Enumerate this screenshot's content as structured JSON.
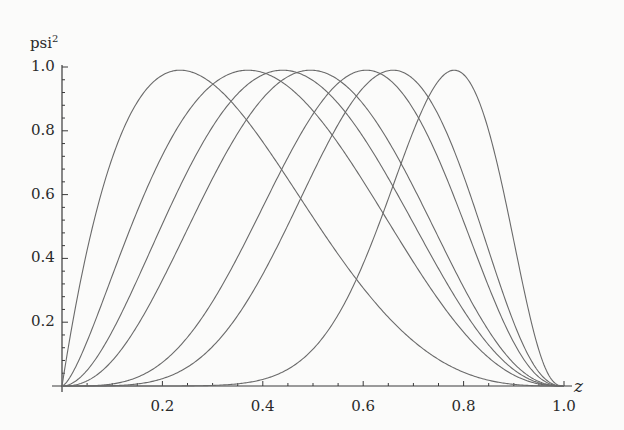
{
  "chart_data": {
    "type": "line",
    "title": "",
    "xlabel": "z",
    "ylabel": "psi",
    "ylabel_sup": "2",
    "xlim": [
      0,
      1.0
    ],
    "ylim": [
      0,
      1.0
    ],
    "x_ticks": [
      0.2,
      0.4,
      0.6,
      0.8,
      1.0
    ],
    "x_tick_labels": [
      "0.2",
      "0.4",
      "0.6",
      "0.8",
      "1.0"
    ],
    "y_ticks": [
      0.2,
      0.4,
      0.6,
      0.8,
      1.0
    ],
    "y_tick_labels": [
      "0.2",
      "0.4",
      "0.6",
      "0.8",
      "1.0"
    ],
    "grid": false,
    "legend": "none",
    "series": [
      {
        "name": "curve-1",
        "peak_z": 0.235,
        "peak_value": 0.99,
        "a": 1.0,
        "b": 3.25
      },
      {
        "name": "curve-2",
        "peak_z": 0.37,
        "peak_value": 0.99,
        "a": 1.5,
        "b": 2.55
      },
      {
        "name": "curve-3",
        "peak_z": 0.44,
        "peak_value": 0.99,
        "a": 2.0,
        "b": 2.55
      },
      {
        "name": "curve-4",
        "peak_z": 0.495,
        "peak_value": 0.99,
        "a": 2.5,
        "b": 2.55
      },
      {
        "name": "curve-5",
        "peak_z": 0.605,
        "peak_value": 0.99,
        "a": 4.0,
        "b": 2.6
      },
      {
        "name": "curve-6",
        "peak_z": 0.66,
        "peak_value": 0.99,
        "a": 5.0,
        "b": 2.58
      },
      {
        "name": "curve-7",
        "peak_z": 0.78,
        "peak_value": 0.99,
        "a": 10.0,
        "b": 2.8
      }
    ]
  },
  "colors": {
    "line": "#6a6a6a",
    "axis": "#3a3a3a",
    "text": "#2a2a2a"
  }
}
